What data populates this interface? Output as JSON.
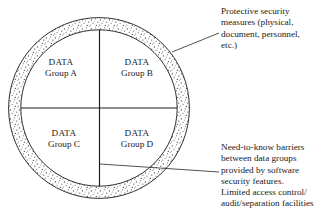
{
  "diagram": {
    "colors": {
      "background": "#ffffff",
      "line": "#1a1a1a",
      "stipple": "#4a4a4a",
      "text": "#1a1a1a"
    },
    "outer_ring": {
      "name": "protective-security-band",
      "center_x": 99,
      "center_y": 108,
      "outer_radius": 91,
      "inner_radius": 78,
      "fill": "stipple-dots"
    },
    "quadrants": [
      {
        "id": "a",
        "line1": "DATA",
        "line2": "Group A"
      },
      {
        "id": "b",
        "line1": "DATA",
        "line2": "Group B"
      },
      {
        "id": "c",
        "line1": "DATA",
        "line2": "Group C"
      },
      {
        "id": "d",
        "line1": "DATA",
        "line2": "Group D"
      }
    ],
    "annotations": {
      "top": {
        "lines": [
          "Protective security",
          "measures (physical,",
          "document, personnel,",
          "etc.)"
        ],
        "leader_from_x": 172,
        "leader_from_y": 52,
        "leader_to_x": 219,
        "leader_to_y": 33
      },
      "bottom": {
        "lines": [
          "Need-to-know barriers",
          "between data groups",
          "provided by software",
          "security features.",
          "Limited access control/",
          "audit/separation facilities"
        ],
        "leader_from_x": 100,
        "leader_from_y": 164,
        "leader_to_x": 219,
        "leader_to_y": 172
      }
    }
  }
}
